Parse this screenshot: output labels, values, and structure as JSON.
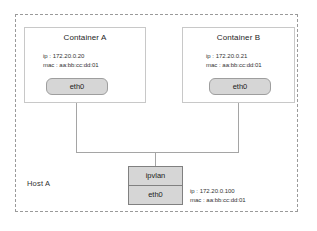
{
  "diagram": {
    "host": {
      "label": "Host A",
      "boundary_style": "dashed",
      "boundary_color": "#9a9a9a",
      "interface": {
        "parent_name": "ipvlan",
        "device_name": "eth0",
        "ip": "ip : 172.20.0.100",
        "mac": "mac : aa:bb:cc:dd:01"
      }
    },
    "containers": [
      {
        "title": "Container A",
        "ip": "ip : 172.20.0.20",
        "mac": "mac : aa:bb:cc:dd:01",
        "interface_label": "eth0"
      },
      {
        "title": "Container B",
        "ip": "ip : 172.20.0.21",
        "mac": "mac : aa:bb:cc:dd:01",
        "interface_label": "eth0"
      }
    ],
    "colors": {
      "pill_fill": "#d6d6d6",
      "pill_border": "#9e9e9e",
      "box_border": "#c8c8c8",
      "wire": "#a5a5a5",
      "text": "#333333"
    }
  }
}
